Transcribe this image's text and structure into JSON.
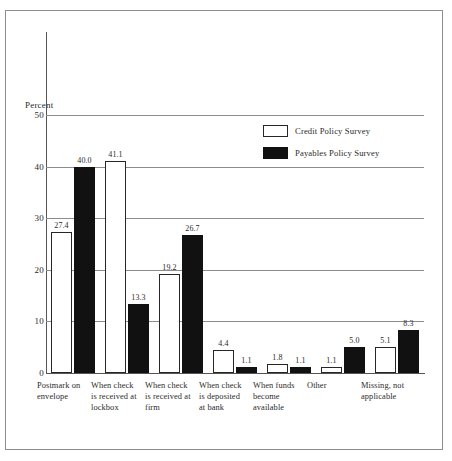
{
  "title": "EXHIBIT 5   RECEIVED PAYMENT DATE",
  "axis": {
    "y_label": "Percent",
    "ticks": [
      "0",
      "10",
      "20",
      "30",
      "40",
      "50"
    ]
  },
  "legend": {
    "items": [
      {
        "label": "Credit Policy Survey",
        "swatch": "white",
        "color": "#ffffff"
      },
      {
        "label": "Payables Policy Survey",
        "swatch": "black",
        "color": "#111111"
      }
    ]
  },
  "chart_data": {
    "type": "bar",
    "title": "EXHIBIT 5   RECEIVED PAYMENT DATE",
    "xlabel": "",
    "ylabel": "Percent",
    "ylim": [
      0,
      50
    ],
    "yticks": [
      0,
      10,
      20,
      30,
      40,
      50
    ],
    "grid": true,
    "legend_position": "upper-right-inside",
    "categories": [
      "Postmark on envelope",
      "When check is received at lockbox",
      "When check is received at firm",
      "When check is deposited at bank",
      "When funds become available",
      "Other",
      "Missing, not applicable"
    ],
    "category_lines": [
      [
        "Postmark on",
        "envelope"
      ],
      [
        "When check",
        "is received at",
        "lockbox"
      ],
      [
        "When check",
        "is received at",
        "firm"
      ],
      [
        "When check",
        "is deposited",
        "at bank"
      ],
      [
        "When funds",
        "become",
        "available"
      ],
      [
        "Other"
      ],
      [
        "Missing, not",
        "applicable"
      ]
    ],
    "series": [
      {
        "name": "Credit Policy Survey",
        "color": "#ffffff",
        "values": [
          27.4,
          41.1,
          19.2,
          4.4,
          1.8,
          1.1,
          5.1
        ],
        "labels": [
          "27.4",
          "41.1",
          "19.2",
          "4.4",
          "1.8",
          "1.1",
          "5.1"
        ]
      },
      {
        "name": "Payables Policy Survey",
        "color": "#111111",
        "values": [
          40.0,
          13.3,
          26.7,
          1.1,
          1.1,
          5.0,
          8.3
        ],
        "labels": [
          "40.0",
          "13.3",
          "26.7",
          "1.1",
          "1.1",
          "5.0",
          "8.3"
        ]
      }
    ]
  }
}
